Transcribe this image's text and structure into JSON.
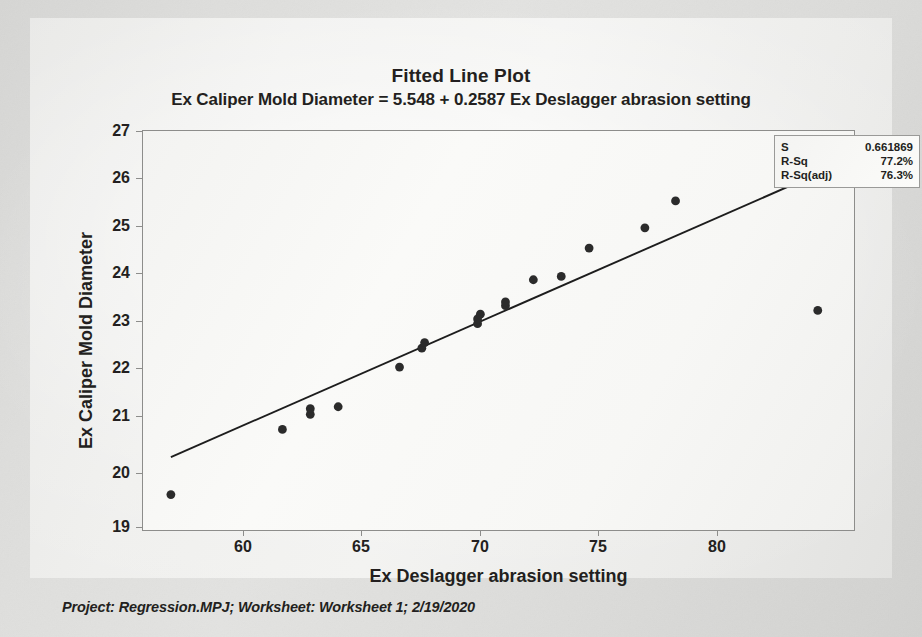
{
  "title": "Fitted Line Plot",
  "subtitle": "Ex Caliper Mold Diameter = 5.548 + 0.2587 Ex Deslagger abrasion setting",
  "footer": "Project: Regression.MPJ; Worksheet: Worksheet 1; 2/19/2020",
  "stats": {
    "rows": [
      {
        "label": "S",
        "value": "0.661869"
      },
      {
        "label": "R-Sq",
        "value": "77.2%"
      },
      {
        "label": "R-Sq(adj)",
        "value": "76.3%"
      }
    ]
  },
  "colors": {
    "marker": "#2b2b2b",
    "fit_line": "#1d1d1d",
    "axis": "#8d8d8b",
    "text": "#231f20",
    "paper": "#e4e4e2"
  },
  "chart_data": {
    "type": "scatter",
    "title": "Fitted Line Plot",
    "subtitle": "Ex Caliper Mold Diameter = 5.548 + 0.2587 Ex Deslagger abrasion setting",
    "xlabel": "Ex Deslagger abrasion setting",
    "ylabel": "Ex Caliper Mold Diameter",
    "xlim": [
      56.0,
      81.5
    ],
    "ylim": [
      18.75,
      27.2
    ],
    "xticks": [
      60,
      65,
      70,
      75,
      80
    ],
    "yticks": [
      19,
      20,
      21,
      22,
      23,
      24,
      25,
      26,
      27
    ],
    "grid": false,
    "legend": false,
    "regression": {
      "intercept": 5.548,
      "slope": 0.2587,
      "equation": "Ex Caliper Mold Diameter = 5.548 + 0.2587 Ex Deslagger abrasion setting",
      "x_start": 57.0,
      "x_end": 80.3,
      "s": 0.661869,
      "r_sq": "77.2%",
      "r_sq_adj": "76.3%"
    },
    "series": [
      {
        "name": "Ex Caliper Mold Diameter",
        "points": [
          [
            57.0,
            19.5
          ],
          [
            61.0,
            20.88
          ],
          [
            62.0,
            21.2
          ],
          [
            62.0,
            21.32
          ],
          [
            63.0,
            21.36
          ],
          [
            65.2,
            22.2
          ],
          [
            66.0,
            22.6
          ],
          [
            66.1,
            22.72
          ],
          [
            68.0,
            23.12
          ],
          [
            68.0,
            23.22
          ],
          [
            68.1,
            23.32
          ],
          [
            69.0,
            23.5
          ],
          [
            69.0,
            23.58
          ],
          [
            70.0,
            24.05
          ],
          [
            71.0,
            24.12
          ],
          [
            72.0,
            24.72
          ],
          [
            74.0,
            25.15
          ],
          [
            75.1,
            25.72
          ],
          [
            80.2,
            23.4
          ]
        ]
      }
    ]
  }
}
